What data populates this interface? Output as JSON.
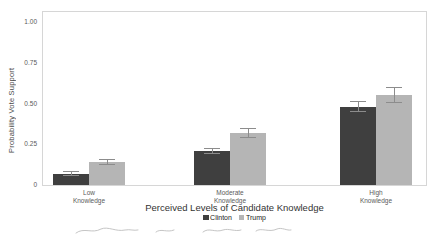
{
  "chart_data": {
    "type": "bar",
    "title": "",
    "xlabel": "Perceived Levels of Candidate Knowledge",
    "ylabel": "Probability Vote Support",
    "categories": [
      "Low\nKnowledge",
      "Moderate\nKnowledge",
      "High\nKnowledge"
    ],
    "series": [
      {
        "name": "Clinton",
        "color": "#3f3f3f",
        "values": [
          0.07,
          0.21,
          0.48
        ],
        "errors": [
          0.015,
          0.02,
          0.035
        ]
      },
      {
        "name": "Trump",
        "color": "#b5b5b5",
        "values": [
          0.14,
          0.32,
          0.55
        ],
        "errors": [
          0.02,
          0.03,
          0.05
        ]
      }
    ],
    "ylim": [
      0,
      1.0
    ],
    "yticks": [
      {
        "value": 0,
        "label": "0"
      },
      {
        "value": 0.25,
        "label": "0.25"
      },
      {
        "value": 0.5,
        "label": "0.50"
      },
      {
        "value": 0.75,
        "label": "0.75"
      },
      {
        "value": 1.0,
        "label": "1.00"
      }
    ],
    "grid": false,
    "legend_position": "bottom",
    "error_bar_color": "#8c8c8c",
    "frame_color": "#d6d6d6",
    "background_color": "#ffffff"
  },
  "footer": {
    "note": "illegible handwritten pencil strokes, cut off at bottom edge"
  }
}
